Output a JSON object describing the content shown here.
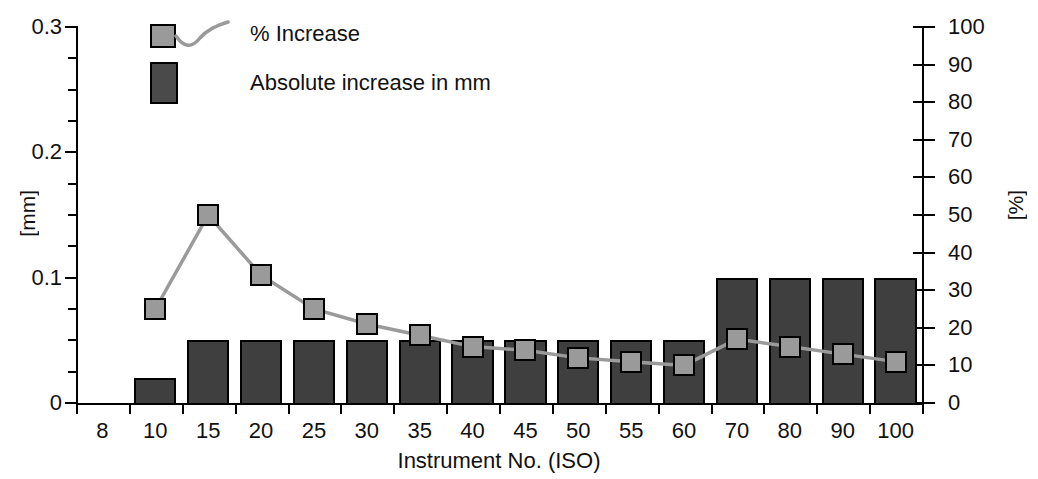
{
  "legend": {
    "position": "top-left-inside",
    "entries": [
      {
        "label": "% Increase",
        "marker": "gray-square-with-line",
        "color": "#9a9a9a",
        "type": "line"
      },
      {
        "label": "Absolute increase in mm",
        "marker": "dark-gray-bar",
        "color": "#4a4a4a",
        "type": "bar"
      }
    ]
  },
  "axes": {
    "left": {
      "unit_label": "[mm]",
      "tick_labels": [
        "0.3",
        "0.2",
        "0.1",
        "0"
      ],
      "tick_values": [
        0.3,
        0.2,
        0.1,
        0
      ],
      "minor_tick_step": 0.025,
      "min": 0,
      "max": 0.3
    },
    "right": {
      "unit_label": "[%]",
      "tick_labels": [
        "100",
        "90",
        "80",
        "70",
        "60",
        "50",
        "40",
        "30",
        "20",
        "10",
        "0"
      ],
      "tick_values": [
        100,
        90,
        80,
        70,
        60,
        50,
        40,
        30,
        20,
        10,
        0
      ],
      "min": 0,
      "max": 100
    },
    "bottom": {
      "title": "Instrument No. (ISO)",
      "tick_labels": [
        "8",
        "10",
        "15",
        "20",
        "25",
        "30",
        "35",
        "40",
        "45",
        "50",
        "55",
        "60",
        "70",
        "80",
        "90",
        "100"
      ]
    }
  },
  "chart_data": {
    "type": "bar",
    "title": "",
    "xlabel": "Instrument No. (ISO)",
    "ylabel": "[mm]",
    "y2label": "[%]",
    "ylim": [
      0,
      0.3
    ],
    "y2lim": [
      0,
      100
    ],
    "grid": false,
    "legend_position": "upper left",
    "categories": [
      "8",
      "10",
      "15",
      "20",
      "25",
      "30",
      "35",
      "40",
      "45",
      "50",
      "55",
      "60",
      "70",
      "80",
      "90",
      "100"
    ],
    "series": [
      {
        "name": "Absolute increase in mm",
        "type": "bar",
        "axis": "left",
        "unit": "mm",
        "color": "#3f3f3f",
        "values": [
          0,
          0.02,
          0.05,
          0.05,
          0.05,
          0.05,
          0.05,
          0.05,
          0.05,
          0.05,
          0.05,
          0.05,
          0.1,
          0.1,
          0.1,
          0.1
        ]
      },
      {
        "name": "% Increase",
        "type": "line",
        "axis": "right",
        "unit": "%",
        "color": "#9a9a9a",
        "values": [
          null,
          25,
          50,
          34,
          25,
          21,
          18,
          15,
          14,
          12,
          11,
          10,
          17,
          15,
          13,
          11
        ]
      }
    ]
  }
}
